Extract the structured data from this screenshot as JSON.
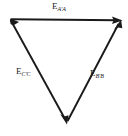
{
  "figure": {
    "type": "vector-triangle-diagram",
    "background_color": "#ffffff",
    "stroke_color": "#1a1a1a",
    "width": 128,
    "height": 136
  },
  "labels": {
    "top": {
      "symbol": "E",
      "subscript": "A′A",
      "full": "E A′A"
    },
    "left": {
      "symbol": "E",
      "subscript": "C′C",
      "full": "E C′C"
    },
    "right": {
      "symbol": "E",
      "subscript": "B′B",
      "full": "E B′B"
    }
  },
  "geometry": {
    "vertices": {
      "top_left": [
        10,
        19
      ],
      "top_right": [
        120,
        20
      ],
      "bottom": [
        67,
        124
      ]
    },
    "edges": [
      {
        "name": "top-edge",
        "from": "top_left",
        "to": "top_right",
        "arrow_at": "to",
        "label": "top"
      },
      {
        "name": "right-edge",
        "from": "bottom",
        "to": "top_right",
        "arrow_at": "to",
        "label": "right"
      },
      {
        "name": "left-edge",
        "from": "top_left",
        "to": "bottom",
        "arrow_at": "to",
        "label": "left"
      }
    ]
  }
}
